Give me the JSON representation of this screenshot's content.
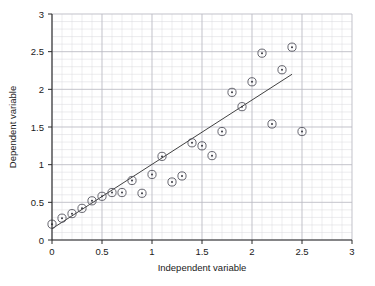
{
  "chart_data": {
    "type": "scatter",
    "title": "",
    "xlabel": "Independent variable",
    "ylabel": "Dependent variable",
    "xlim": [
      0,
      3
    ],
    "ylim": [
      0,
      3
    ],
    "xticks": [
      0,
      0.5,
      1,
      1.5,
      2,
      2.5,
      3
    ],
    "yticks": [
      0,
      0.5,
      1,
      1.5,
      2,
      2.5,
      3
    ],
    "xtick_labels": [
      "0",
      "0.5",
      "1",
      "1.5",
      "2",
      "2.5",
      "3"
    ],
    "ytick_labels": [
      "0",
      "0.5",
      "1",
      "1.5",
      "2",
      "2.5",
      "3"
    ],
    "grid": true,
    "grid_minor_step": 0.1,
    "grid_major_step": 0.5,
    "legend": null,
    "marker_style": "circle-with-center-dot",
    "series": [
      {
        "name": "observations",
        "type": "scatter",
        "x": [
          0.0,
          0.1,
          0.2,
          0.3,
          0.4,
          0.5,
          0.6,
          0.7,
          0.8,
          0.9,
          1.0,
          1.1,
          1.2,
          1.3,
          1.4,
          1.5,
          1.6,
          1.7,
          1.8,
          1.9,
          2.0,
          2.1,
          2.2,
          2.3,
          2.4,
          2.5
        ],
        "y": [
          0.21,
          0.29,
          0.35,
          0.42,
          0.52,
          0.58,
          0.63,
          0.63,
          0.79,
          0.62,
          0.87,
          1.11,
          0.77,
          0.85,
          1.29,
          1.25,
          1.12,
          1.44,
          1.96,
          1.77,
          2.1,
          2.48,
          1.54,
          2.26,
          2.56,
          1.44
        ]
      },
      {
        "name": "fitted-line",
        "type": "line",
        "x": [
          0.0,
          2.4
        ],
        "y": [
          0.15,
          2.2
        ]
      }
    ]
  },
  "colors": {
    "marker_stroke": "#55555f",
    "marker_dot": "#3a3a42",
    "trend_line": "#2b2b2b",
    "axis": "#2b2b2b",
    "grid_minor": "#d8d8dc",
    "grid_major": "#b9b9c2",
    "background": "#ffffff",
    "text": "#1a1a1a"
  }
}
